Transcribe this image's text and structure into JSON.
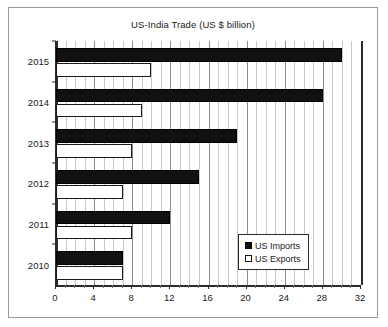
{
  "chart_data": {
    "type": "bar",
    "orientation": "horizontal",
    "title": "US-India Trade (US $ billion)",
    "xlabel": "",
    "ylabel": "",
    "categories": [
      "2015",
      "2014",
      "2013",
      "2012",
      "2011",
      "2010"
    ],
    "series": [
      {
        "name": "US Imports",
        "values": [
          30,
          28,
          19,
          15,
          12,
          7
        ],
        "color": "#111111"
      },
      {
        "name": "US Exports",
        "values": [
          10,
          9,
          8,
          7,
          8,
          7
        ],
        "color": "#ffffff"
      }
    ],
    "xlim": [
      0,
      32
    ],
    "xticks": [
      0,
      4,
      8,
      12,
      16,
      20,
      24,
      28,
      32
    ],
    "xticklabels": [
      "0",
      "4",
      "8",
      "12",
      "16",
      "20",
      "24",
      "28",
      "32"
    ],
    "minor_tick_step": 1,
    "grid": true,
    "grid_axis": "x",
    "legend": {
      "position": "lower-right",
      "entries": [
        {
          "label": "US Imports",
          "swatch": "filled-square"
        },
        {
          "label": "US Exports",
          "swatch": "open-square"
        }
      ]
    }
  }
}
